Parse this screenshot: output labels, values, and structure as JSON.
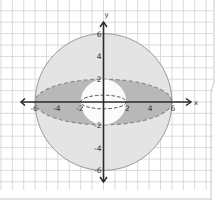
{
  "figure": {
    "x_axis_label": "x",
    "y_axis_label": "y",
    "x_ticks": [
      {
        "value": -6,
        "label": "-6"
      },
      {
        "value": -4,
        "label": "-4"
      },
      {
        "value": -2,
        "label": "-2"
      },
      {
        "value": 2,
        "label": "2"
      },
      {
        "value": 4,
        "label": "4"
      },
      {
        "value": 6,
        "label": "6"
      }
    ],
    "y_ticks": [
      {
        "value": 6,
        "label": "6"
      },
      {
        "value": 4,
        "label": "4"
      },
      {
        "value": 2,
        "label": "2"
      },
      {
        "value": -2,
        "label": "-2"
      },
      {
        "value": -4,
        "label": "-4"
      },
      {
        "value": -6,
        "label": "-6"
      }
    ],
    "outer_sphere_radius": 6,
    "inner_sphere_radius": 2,
    "equator_ellipse": {
      "rx": 6,
      "ry": 2
    },
    "inner_equator_ellipse": {
      "rx": 2,
      "ry": 0.5
    },
    "colors": {
      "paper": "#ffffff",
      "grid": "#d2d2d2",
      "outer_fill": "#e4e4e4",
      "outer_stroke": "#9a9a9a",
      "ellipse_fill": "#b8b8b8",
      "ellipse_stroke": "#8a8a8a",
      "inner_fill": "#fbfbfb",
      "axis": "#2a2a2a",
      "label": "#333333"
    }
  }
}
